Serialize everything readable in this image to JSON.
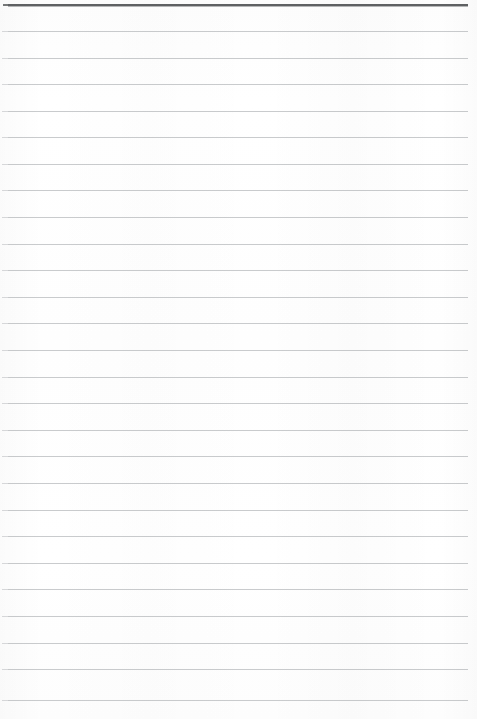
{
  "document": {
    "kind": "scanned-ruled-paper",
    "title": "Blank Lined Notebook Page",
    "content_text": "",
    "page_width": 477,
    "page_height": 719,
    "has_text": false,
    "has_handwriting": false
  },
  "paper": {
    "background_color": "#ffffff",
    "surface_tint_color": "#fdfdfd"
  },
  "ruling": {
    "line_count": 27,
    "line_color": "#c9cbcd",
    "line_thickness_px": 1,
    "line_spacing_px": 26.6,
    "first_line_y": 4,
    "line_start_x": 8,
    "line_end_x": 468,
    "header_rule_color": "#5f6163",
    "header_rule_thickness_px": 2,
    "lines": [
      {
        "index": 0,
        "y": 4,
        "emphasis": "header",
        "color": "#5f6163"
      },
      {
        "index": 1,
        "y": 31,
        "emphasis": "normal",
        "color": "#c9cbcd"
      },
      {
        "index": 2,
        "y": 58,
        "emphasis": "normal",
        "color": "#c9cbcd"
      },
      {
        "index": 3,
        "y": 84,
        "emphasis": "normal",
        "color": "#c9cbcd"
      },
      {
        "index": 4,
        "y": 111,
        "emphasis": "normal",
        "color": "#c9cbcd"
      },
      {
        "index": 5,
        "y": 137,
        "emphasis": "normal",
        "color": "#c9cbcd"
      },
      {
        "index": 6,
        "y": 164,
        "emphasis": "normal",
        "color": "#c9cbcd"
      },
      {
        "index": 7,
        "y": 190,
        "emphasis": "normal",
        "color": "#c9cbcd"
      },
      {
        "index": 8,
        "y": 217,
        "emphasis": "normal",
        "color": "#c9cbcd"
      },
      {
        "index": 9,
        "y": 244,
        "emphasis": "normal",
        "color": "#c9cbcd"
      },
      {
        "index": 10,
        "y": 270,
        "emphasis": "normal",
        "color": "#c9cbcd"
      },
      {
        "index": 11,
        "y": 297,
        "emphasis": "normal",
        "color": "#c9cbcd"
      },
      {
        "index": 12,
        "y": 323,
        "emphasis": "normal",
        "color": "#c9cbcd"
      },
      {
        "index": 13,
        "y": 350,
        "emphasis": "normal",
        "color": "#c9cbcd"
      },
      {
        "index": 14,
        "y": 377,
        "emphasis": "normal",
        "color": "#c9cbcd"
      },
      {
        "index": 15,
        "y": 403,
        "emphasis": "normal",
        "color": "#c9cbcd"
      },
      {
        "index": 16,
        "y": 430,
        "emphasis": "normal",
        "color": "#c9cbcd"
      },
      {
        "index": 17,
        "y": 456,
        "emphasis": "normal",
        "color": "#c9cbcd"
      },
      {
        "index": 18,
        "y": 483,
        "emphasis": "normal",
        "color": "#c9cbcd"
      },
      {
        "index": 19,
        "y": 510,
        "emphasis": "normal",
        "color": "#c9cbcd"
      },
      {
        "index": 20,
        "y": 536,
        "emphasis": "normal",
        "color": "#c9cbcd"
      },
      {
        "index": 21,
        "y": 563,
        "emphasis": "normal",
        "color": "#c9cbcd"
      },
      {
        "index": 22,
        "y": 589,
        "emphasis": "normal",
        "color": "#c9cbcd"
      },
      {
        "index": 23,
        "y": 616,
        "emphasis": "normal",
        "color": "#c9cbcd"
      },
      {
        "index": 24,
        "y": 643,
        "emphasis": "normal",
        "color": "#c9cbcd"
      },
      {
        "index": 25,
        "y": 669,
        "emphasis": "normal",
        "color": "#c9cbcd"
      },
      {
        "index": 26,
        "y": 700,
        "emphasis": "normal",
        "color": "#c9cbcd"
      }
    ]
  }
}
